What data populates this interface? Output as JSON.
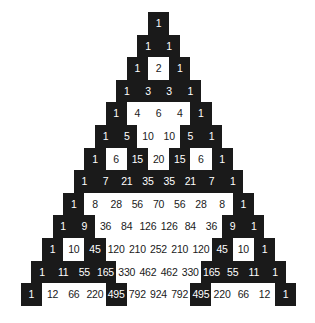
{
  "figure": {
    "name": "pascals-triangle-parity",
    "colors": {
      "odd_background": "#1a1a1a",
      "odd_text": "#ffffff",
      "even_background": "#ffffff",
      "even_text": "#1a1a1a",
      "page_background": "#ffffff"
    },
    "geometry": {
      "cell_width": 21.2,
      "cell_height": 22.6,
      "apex_left": 148,
      "apex_top": 12,
      "rows": 13
    }
  },
  "chart_data": {
    "type": "heatmap",
    "xlabel": "",
    "ylabel": "",
    "legend": [
      {
        "label": "odd value",
        "color": "#1a1a1a"
      },
      {
        "label": "even value",
        "color": "#ffffff"
      }
    ],
    "row_labels": [
      0,
      1,
      2,
      3,
      4,
      5,
      6,
      7,
      8,
      9,
      10,
      11,
      12
    ],
    "rows": [
      [
        1
      ],
      [
        1,
        1
      ],
      [
        1,
        2,
        1
      ],
      [
        1,
        3,
        3,
        1
      ],
      [
        1,
        4,
        6,
        4,
        1
      ],
      [
        1,
        5,
        10,
        10,
        5,
        1
      ],
      [
        1,
        6,
        15,
        20,
        15,
        6,
        1
      ],
      [
        1,
        7,
        21,
        35,
        35,
        21,
        7,
        1
      ],
      [
        1,
        8,
        28,
        56,
        70,
        56,
        28,
        8,
        1
      ],
      [
        1,
        9,
        36,
        84,
        126,
        126,
        84,
        36,
        9,
        1
      ],
      [
        1,
        10,
        45,
        120,
        210,
        252,
        210,
        120,
        45,
        10,
        1
      ],
      [
        1,
        11,
        55,
        165,
        330,
        462,
        462,
        330,
        165,
        55,
        11,
        1
      ],
      [
        1,
        12,
        66,
        220,
        495,
        792,
        924,
        792,
        495,
        220,
        66,
        12,
        1
      ]
    ],
    "parity": [
      [
        "odd"
      ],
      [
        "odd",
        "odd"
      ],
      [
        "odd",
        "even",
        "odd"
      ],
      [
        "odd",
        "odd",
        "odd",
        "odd"
      ],
      [
        "odd",
        "even",
        "even",
        "even",
        "odd"
      ],
      [
        "odd",
        "odd",
        "even",
        "even",
        "odd",
        "odd"
      ],
      [
        "odd",
        "even",
        "odd",
        "even",
        "odd",
        "even",
        "odd"
      ],
      [
        "odd",
        "odd",
        "odd",
        "odd",
        "odd",
        "odd",
        "odd",
        "odd"
      ],
      [
        "odd",
        "even",
        "even",
        "even",
        "even",
        "even",
        "even",
        "even",
        "odd"
      ],
      [
        "odd",
        "odd",
        "even",
        "even",
        "even",
        "even",
        "even",
        "even",
        "odd",
        "odd"
      ],
      [
        "odd",
        "even",
        "odd",
        "even",
        "even",
        "even",
        "even",
        "even",
        "odd",
        "even",
        "odd"
      ],
      [
        "odd",
        "odd",
        "odd",
        "odd",
        "even",
        "even",
        "even",
        "even",
        "odd",
        "odd",
        "odd",
        "odd"
      ],
      [
        "odd",
        "even",
        "even",
        "even",
        "odd",
        "even",
        "even",
        "even",
        "odd",
        "even",
        "even",
        "even",
        "odd"
      ]
    ]
  }
}
